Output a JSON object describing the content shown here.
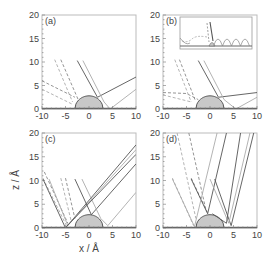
{
  "figure": {
    "xlabel": "x / Å",
    "ylabel": "z / Å"
  },
  "chart_data": [
    {
      "panel": "(a)",
      "type": "line",
      "xlim": [
        -10,
        10
      ],
      "ylim": [
        0,
        20
      ],
      "xticks": [
        -10,
        -5,
        0,
        5,
        10
      ],
      "yticks": [
        0,
        5,
        10,
        15,
        20
      ],
      "surface_bump": {
        "center": 0,
        "half_width": 3,
        "height": 2.8,
        "fill": "#c8c8c8"
      },
      "series": [
        {
          "name": "dashed-1",
          "style": "dashed",
          "color": "#888",
          "points": [
            [
              -10,
              6
            ],
            [
              -3,
              2.5
            ]
          ]
        },
        {
          "name": "dashed-2",
          "style": "dashed",
          "color": "#aaa",
          "points": [
            [
              -10,
              4.2
            ],
            [
              -3.5,
              1
            ]
          ]
        },
        {
          "name": "dashed-3",
          "style": "dashed",
          "color": "#888",
          "points": [
            [
              -6,
              10.5
            ],
            [
              -2.3,
              2
            ]
          ]
        },
        {
          "name": "dashed-4",
          "style": "dashed",
          "color": "#aaa",
          "points": [
            [
              -7.3,
              10.5
            ],
            [
              -3.5,
              1.5
            ]
          ]
        },
        {
          "name": "solid-1",
          "style": "solid",
          "color": "#555",
          "points": [
            [
              -2.5,
              10.3
            ],
            [
              1.8,
              2.5
            ],
            [
              10,
              6.8
            ]
          ]
        },
        {
          "name": "solid-2",
          "style": "solid",
          "color": "#aaa",
          "points": [
            [
              -1.3,
              10.3
            ],
            [
              3.2,
              1.5
            ],
            [
              4.5,
              0
            ],
            [
              10,
              4.2
            ]
          ]
        }
      ]
    },
    {
      "panel": "(b)",
      "type": "line",
      "xlim": [
        -10,
        10
      ],
      "ylim": [
        0,
        20
      ],
      "xticks": [
        -10,
        -5,
        0,
        5,
        10
      ],
      "yticks": [
        0,
        5,
        10,
        15,
        20
      ],
      "surface_bump": {
        "center": 0,
        "half_width": 3,
        "height": 2.8,
        "fill": "#c8c8c8"
      },
      "inset": true,
      "series": [
        {
          "name": "dashed-1",
          "style": "dashed",
          "color": "#888",
          "points": [
            [
              -10,
              3.5
            ],
            [
              -5,
              3.3
            ],
            [
              -2.5,
              2
            ]
          ]
        },
        {
          "name": "dashed-2",
          "style": "dashed",
          "color": "#aaa",
          "points": [
            [
              -10,
              3
            ],
            [
              -4,
              1.5
            ]
          ]
        },
        {
          "name": "dashed-3",
          "style": "dashed",
          "color": "#888",
          "points": [
            [
              -6.5,
              10.5
            ],
            [
              -3.2,
              2
            ]
          ]
        },
        {
          "name": "dashed-4",
          "style": "dashed",
          "color": "#aaa",
          "points": [
            [
              -7.5,
              10.5
            ],
            [
              -4,
              1.5
            ]
          ]
        },
        {
          "name": "solid-1",
          "style": "solid",
          "color": "#555",
          "points": [
            [
              -2.5,
              10.3
            ],
            [
              1.8,
              2.5
            ],
            [
              10,
              3.5
            ]
          ]
        },
        {
          "name": "solid-2",
          "style": "solid",
          "color": "#aaa",
          "points": [
            [
              -1.3,
              10.3
            ],
            [
              3,
              2
            ],
            [
              5.5,
              0
            ],
            [
              10,
              2.5
            ]
          ]
        }
      ]
    },
    {
      "panel": "(c)",
      "type": "line",
      "xlim": [
        -10,
        10
      ],
      "ylim": [
        0,
        20
      ],
      "xticks": [
        -10,
        -5,
        0,
        5,
        10
      ],
      "yticks": [
        0,
        5,
        10,
        15,
        20
      ],
      "surface_bump": {
        "center": 0,
        "half_width": 3,
        "height": 2.8,
        "fill": "#c8c8c8"
      },
      "series": [
        {
          "name": "dashed-1",
          "style": "dashed",
          "color": "#888",
          "points": [
            [
              -9.5,
              11.8
            ],
            [
              -4.5,
              1
            ]
          ]
        },
        {
          "name": "dashed-2",
          "style": "dashed",
          "color": "#aaa",
          "points": [
            [
              -9.8,
              10.5
            ],
            [
              -4.8,
              0.5
            ]
          ]
        },
        {
          "name": "dashed-3",
          "style": "dashed",
          "color": "#888",
          "points": [
            [
              -5,
              10.5
            ],
            [
              -3,
              2
            ]
          ]
        },
        {
          "name": "dashed-4",
          "style": "dashed",
          "color": "#aaa",
          "points": [
            [
              -6,
              10.5
            ],
            [
              -3.8,
              1.5
            ]
          ]
        },
        {
          "name": "solid-1",
          "style": "solid",
          "color": "#555",
          "points": [
            [
              -9.8,
              10.3
            ],
            [
              -5,
              0
            ],
            [
              10,
              17.5
            ]
          ]
        },
        {
          "name": "solid-2",
          "style": "solid",
          "color": "#aaa",
          "points": [
            [
              -8.5,
              10.3
            ],
            [
              -4.5,
              0.5
            ],
            [
              10,
              16.5
            ]
          ]
        },
        {
          "name": "solid-3",
          "style": "solid",
          "color": "#555",
          "points": [
            [
              -3,
              10.3
            ],
            [
              0.5,
              2.8
            ],
            [
              10,
              13.5
            ]
          ]
        },
        {
          "name": "solid-4",
          "style": "solid",
          "color": "#aaa",
          "points": [
            [
              -1.5,
              10.3
            ],
            [
              2.5,
              2
            ],
            [
              4,
              0.5
            ],
            [
              10,
              7.5
            ]
          ]
        },
        {
          "name": "solid-5",
          "style": "solid",
          "color": "#555",
          "points": [
            [
              -4.8,
              0.3
            ],
            [
              10,
              15.5
            ]
          ]
        }
      ]
    },
    {
      "panel": "(d)",
      "type": "line",
      "xlim": [
        -10,
        10
      ],
      "ylim": [
        0,
        20
      ],
      "xticks": [
        -10,
        -5,
        0,
        5,
        10
      ],
      "yticks": [
        0,
        5,
        10,
        15,
        20
      ],
      "surface_bump": {
        "center": 0,
        "half_width": 3,
        "height": 2.8,
        "fill": "#c8c8c8"
      },
      "series": [
        {
          "name": "dashed-1",
          "style": "dashed",
          "color": "#888",
          "points": [
            [
              -4.5,
              20
            ],
            [
              -0.8,
              3.5
            ]
          ]
        },
        {
          "name": "dashed-2",
          "style": "dashed",
          "color": "#aaa",
          "points": [
            [
              -7,
              20
            ],
            [
              -3,
              2
            ]
          ]
        },
        {
          "name": "dashed-3",
          "style": "dashed",
          "color": "#888",
          "points": [
            [
              -4,
              10.5
            ],
            [
              -0.5,
              3.2
            ]
          ]
        },
        {
          "name": "dashed-4",
          "style": "dashed",
          "color": "#aaa",
          "points": [
            [
              -8,
              10.5
            ],
            [
              -3.5,
              0.5
            ]
          ]
        },
        {
          "name": "solid-1",
          "style": "solid",
          "color": "#555",
          "points": [
            [
              -4,
              10.3
            ],
            [
              -0.5,
              3
            ],
            [
              3.5,
              20
            ]
          ]
        },
        {
          "name": "solid-2",
          "style": "solid",
          "color": "#aaa",
          "points": [
            [
              -8,
              10.3
            ],
            [
              -3.3,
              0.3
            ],
            [
              1.5,
              20
            ]
          ]
        },
        {
          "name": "solid-3",
          "style": "solid",
          "color": "#555",
          "points": [
            [
              1,
              10.3
            ],
            [
              4.5,
              0.5
            ],
            [
              9.3,
              20
            ]
          ]
        },
        {
          "name": "solid-4",
          "style": "solid",
          "color": "#aaa",
          "points": [
            [
              0,
              10.3
            ],
            [
              4,
              1
            ],
            [
              8.5,
              20
            ]
          ]
        },
        {
          "name": "solid-5",
          "style": "solid",
          "color": "#555",
          "points": [
            [
              0.5,
              3
            ],
            [
              3.5,
              1
            ],
            [
              6.5,
              20
            ]
          ]
        }
      ]
    }
  ]
}
